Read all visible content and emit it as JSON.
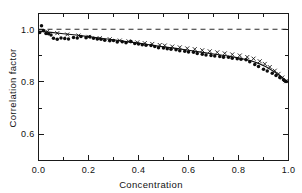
{
  "figure": {
    "background_color": "#ffffff",
    "foreground_color": "#111111",
    "width": 302,
    "height": 193
  },
  "chart_data": {
    "type": "scatter",
    "title": "",
    "subtitle": "",
    "xlabel": "Concentration",
    "ylabel": "Correlation factor",
    "xlim": [
      0.0,
      1.0
    ],
    "ylim": [
      0.5,
      1.06
    ],
    "grid": false,
    "legend": null,
    "legend_position": "none",
    "frame": "box",
    "tick_direction": "in",
    "xticks": [
      0.0,
      0.2,
      0.4,
      0.6,
      0.8,
      1.0
    ],
    "xticklabels": [
      "0.0",
      "0.2",
      "0.4",
      "0.6",
      "0.8",
      "1.0"
    ],
    "xminorticks": [
      0.1,
      0.3,
      0.5,
      0.7,
      0.9
    ],
    "yticks": [
      0.6,
      0.8,
      1.0
    ],
    "yticklabels": [
      "0.6",
      "0.8",
      "1.0"
    ],
    "yminorticks": [
      0.7,
      0.9
    ],
    "annotations": [
      {
        "name": "unity-reference-line",
        "type": "hline",
        "y": 1.0,
        "style": "dashed",
        "label": ""
      }
    ],
    "series": [
      {
        "name": "measured-dots",
        "marker": "filled-circle",
        "color": "#0c0c0c",
        "x": [
          0.005,
          0.012,
          0.02,
          0.03,
          0.04,
          0.05,
          0.06,
          0.075,
          0.09,
          0.105,
          0.12,
          0.14,
          0.155,
          0.17,
          0.19,
          0.205,
          0.22,
          0.235,
          0.25,
          0.265,
          0.285,
          0.3,
          0.315,
          0.335,
          0.35,
          0.37,
          0.385,
          0.4,
          0.415,
          0.43,
          0.45,
          0.465,
          0.48,
          0.5,
          0.515,
          0.53,
          0.55,
          0.565,
          0.585,
          0.6,
          0.62,
          0.635,
          0.655,
          0.67,
          0.69,
          0.705,
          0.725,
          0.74,
          0.76,
          0.775,
          0.795,
          0.81,
          0.83,
          0.845,
          0.865,
          0.88,
          0.9,
          0.915,
          0.935,
          0.95,
          0.965,
          0.98,
          0.99
        ],
        "y": [
          0.988,
          1.013,
          0.995,
          0.984,
          0.983,
          0.978,
          0.966,
          0.962,
          0.967,
          0.965,
          0.963,
          0.969,
          0.967,
          0.972,
          0.968,
          0.971,
          0.966,
          0.963,
          0.962,
          0.958,
          0.956,
          0.957,
          0.951,
          0.952,
          0.949,
          0.953,
          0.946,
          0.944,
          0.941,
          0.939,
          0.938,
          0.934,
          0.93,
          0.929,
          0.926,
          0.924,
          0.922,
          0.918,
          0.916,
          0.913,
          0.912,
          0.908,
          0.905,
          0.902,
          0.9,
          0.898,
          0.896,
          0.893,
          0.893,
          0.89,
          0.888,
          0.886,
          0.884,
          0.876,
          0.866,
          0.858,
          0.848,
          0.841,
          0.832,
          0.824,
          0.816,
          0.808,
          0.801
        ],
        "count": 63
      },
      {
        "name": "measured-crosses",
        "marker": "cross",
        "color": "#0c0c0c",
        "x": [
          0.035,
          0.075,
          0.115,
          0.16,
          0.2,
          0.245,
          0.285,
          0.325,
          0.36,
          0.395,
          0.425,
          0.455,
          0.485,
          0.505,
          0.535,
          0.565,
          0.595,
          0.625,
          0.655,
          0.685,
          0.715,
          0.745,
          0.775,
          0.805,
          0.835,
          0.86,
          0.885,
          0.905,
          0.925,
          0.945,
          0.96,
          0.975,
          0.99
        ],
        "y": [
          0.991,
          0.985,
          0.98,
          0.976,
          0.971,
          0.966,
          0.962,
          0.957,
          0.954,
          0.95,
          0.947,
          0.944,
          0.94,
          0.938,
          0.934,
          0.931,
          0.927,
          0.924,
          0.92,
          0.916,
          0.912,
          0.908,
          0.904,
          0.9,
          0.894,
          0.888,
          0.878,
          0.868,
          0.856,
          0.842,
          0.83,
          0.816,
          0.802
        ],
        "count": 33
      },
      {
        "name": "fitted-curve",
        "marker": "line",
        "color": "#111111",
        "x": [
          0.0,
          0.05,
          0.1,
          0.15,
          0.2,
          0.25,
          0.3,
          0.35,
          0.4,
          0.45,
          0.5,
          0.55,
          0.6,
          0.65,
          0.7,
          0.75,
          0.8,
          0.85,
          0.88,
          0.91,
          0.94,
          0.97,
          1.0
        ],
        "y": [
          0.993,
          0.988,
          0.983,
          0.978,
          0.972,
          0.966,
          0.96,
          0.953,
          0.947,
          0.94,
          0.933,
          0.927,
          0.92,
          0.913,
          0.906,
          0.899,
          0.891,
          0.88,
          0.87,
          0.857,
          0.84,
          0.82,
          0.798
        ],
        "count": 23
      }
    ]
  }
}
